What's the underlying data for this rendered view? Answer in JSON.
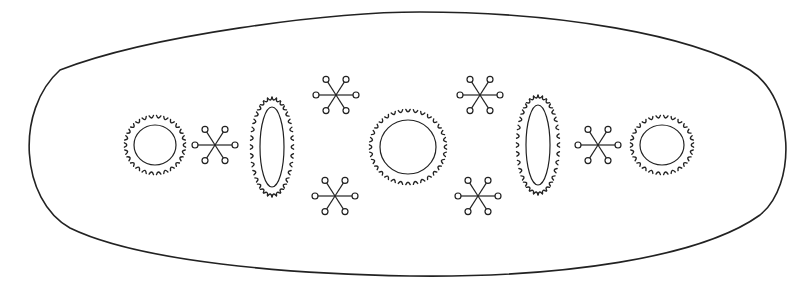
{
  "figure": {
    "colors": {
      "ink": "#222222",
      "background": "#ffffff"
    },
    "outline": {
      "path": "M 60 70 C 150 35, 330 12, 420 12 C 560 12, 690 35, 750 70 C 795 100, 797 185, 760 215 C 700 258, 560 278, 410 276 C 290 274, 140 262, 70 228 C 20 200, 15 110, 60 70 Z"
    },
    "serrated_circles": [
      {
        "id": "left-circle",
        "cx": 155,
        "cy": 145,
        "inner_rx": 21,
        "inner_ry": 20,
        "ring_rx": 29,
        "ring_ry": 28,
        "teeth": 26
      },
      {
        "id": "center-circle",
        "cx": 408,
        "cy": 147,
        "inner_rx": 28,
        "inner_ry": 27,
        "ring_rx": 37,
        "ring_ry": 36,
        "teeth": 32
      },
      {
        "id": "right-circle",
        "cx": 662,
        "cy": 145,
        "inner_rx": 22,
        "inner_ry": 20,
        "ring_rx": 30,
        "ring_ry": 28,
        "teeth": 26
      }
    ],
    "serrated_ovals": [
      {
        "id": "left-oval",
        "cx": 272,
        "cy": 147,
        "inner_rx": 12,
        "inner_ry": 40,
        "ring_rx": 20,
        "ring_ry": 48,
        "teeth": 34
      },
      {
        "id": "right-oval",
        "cx": 538,
        "cy": 145,
        "inner_rx": 12,
        "inner_ry": 40,
        "ring_rx": 20,
        "ring_ry": 48,
        "teeth": 34
      }
    ],
    "stars": [
      {
        "id": "left-star",
        "cx": 215,
        "cy": 145,
        "arm": 20,
        "node_r": 3
      },
      {
        "id": "top-left-star",
        "cx": 336,
        "cy": 95,
        "arm": 20,
        "node_r": 3
      },
      {
        "id": "bottom-left-star",
        "cx": 335,
        "cy": 196,
        "arm": 20,
        "node_r": 3
      },
      {
        "id": "top-right-star",
        "cx": 480,
        "cy": 95,
        "arm": 20,
        "node_r": 3
      },
      {
        "id": "bottom-right-star",
        "cx": 478,
        "cy": 196,
        "arm": 20,
        "node_r": 3
      },
      {
        "id": "right-star",
        "cx": 598,
        "cy": 145,
        "arm": 20,
        "node_r": 3
      }
    ]
  }
}
